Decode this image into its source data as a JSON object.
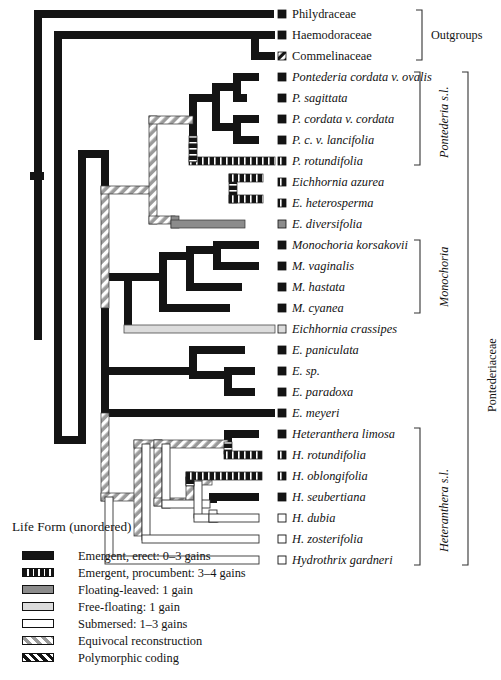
{
  "figure": {
    "name": "pontederiaceae-life-form-phylogeny",
    "width": 501,
    "height": 680
  },
  "taxa": [
    {
      "id": "philydraceae",
      "label": "Philydraceae",
      "italic": false,
      "y": 14,
      "branch_x": 272,
      "state": "emergent-erect",
      "box": "emergent-erect"
    },
    {
      "id": "haemodoraceae",
      "label": "Haemodoraceae",
      "italic": false,
      "y": 35,
      "branch_x": 255,
      "state": "emergent-erect",
      "box": "emergent-erect"
    },
    {
      "id": "commelinaceae",
      "label": "Commelinaceae",
      "italic": false,
      "y": 56,
      "branch_x": 255,
      "state": "emergent-erect",
      "box": "polymorphic"
    },
    {
      "id": "pontederia-cordata-ovalis",
      "label": "Pontederia cordata v. ovalis",
      "italic": true,
      "y": 77,
      "branch_x": 258,
      "state": "emergent-erect",
      "box": "emergent-erect"
    },
    {
      "id": "p-sagittata",
      "label": "P. sagittata",
      "italic": true,
      "y": 98,
      "branch_x": 245,
      "state": "emergent-erect",
      "box": "emergent-erect"
    },
    {
      "id": "p-cordata-cordata",
      "label": "P. cordata v. cordata",
      "italic": true,
      "y": 119,
      "branch_x": 258,
      "state": "emergent-erect",
      "box": "emergent-erect"
    },
    {
      "id": "p-c-lancifolia",
      "label": "P. c. v. lancifolia",
      "italic": true,
      "y": 140,
      "branch_x": 258,
      "state": "emergent-erect",
      "box": "emergent-erect"
    },
    {
      "id": "p-rotundifolia",
      "label": "P. rotundifolia",
      "italic": true,
      "y": 161,
      "branch_x": 215,
      "state": "emergent-procumbent",
      "box": "emergent-procumbent"
    },
    {
      "id": "eichhornia-azurea",
      "label": "Eichhornia azurea",
      "italic": true,
      "y": 182,
      "branch_x": 258,
      "state": "emergent-procumbent",
      "box": "emergent-procumbent"
    },
    {
      "id": "e-heterosperma",
      "label": "E. heterosperma",
      "italic": true,
      "y": 203,
      "branch_x": 258,
      "state": "emergent-procumbent",
      "box": "emergent-procumbent"
    },
    {
      "id": "e-diversifolia",
      "label": "E. diversifolia",
      "italic": true,
      "y": 224,
      "branch_x": 245,
      "state": "floating-leaved",
      "box": "floating-leaved"
    },
    {
      "id": "monochoria-korsakovii",
      "label": "Monochoria korsakovii",
      "italic": true,
      "y": 245,
      "branch_x": 258,
      "state": "emergent-erect",
      "box": "emergent-erect"
    },
    {
      "id": "m-vaginalis",
      "label": "M. vaginalis",
      "italic": true,
      "y": 266,
      "branch_x": 258,
      "state": "emergent-erect",
      "box": "emergent-erect"
    },
    {
      "id": "m-hastata",
      "label": "M. hastata",
      "italic": true,
      "y": 287,
      "branch_x": 240,
      "state": "emergent-erect",
      "box": "emergent-erect"
    },
    {
      "id": "m-cyanea",
      "label": "M. cyanea",
      "italic": true,
      "y": 308,
      "branch_x": 228,
      "state": "emergent-erect",
      "box": "emergent-erect"
    },
    {
      "id": "eichhornia-crassipes",
      "label": "Eichhornia crassipes",
      "italic": true,
      "y": 329,
      "branch_x": 150,
      "state": "free-floating",
      "box": "free-floating"
    },
    {
      "id": "e-paniculata",
      "label": "E. paniculata",
      "italic": true,
      "y": 350,
      "branch_x": 233,
      "state": "emergent-erect",
      "box": "emergent-erect"
    },
    {
      "id": "e-sp",
      "label": "E. sp.",
      "italic": true,
      "y": 371,
      "branch_x": 253,
      "state": "emergent-erect",
      "box": "emergent-erect"
    },
    {
      "id": "e-paradoxa",
      "label": "E. paradoxa",
      "italic": true,
      "y": 392,
      "branch_x": 253,
      "state": "emergent-erect",
      "box": "emergent-erect"
    },
    {
      "id": "e-meyeri",
      "label": "E. meyeri",
      "italic": true,
      "y": 413,
      "branch_x": 102,
      "state": "emergent-erect",
      "box": "emergent-erect"
    },
    {
      "id": "heteranthera-limosa",
      "label": "Heteranthera limosa",
      "italic": true,
      "y": 434,
      "branch_x": 258,
      "state": "emergent-erect",
      "box": "emergent-erect"
    },
    {
      "id": "h-rotundifolia",
      "label": "H. rotundifolia",
      "italic": true,
      "y": 455,
      "branch_x": 258,
      "state": "emergent-procumbent",
      "box": "emergent-procumbent"
    },
    {
      "id": "h-oblongifolia",
      "label": "H. oblongifolia",
      "italic": true,
      "y": 476,
      "branch_x": 232,
      "state": "emergent-procumbent",
      "box": "emergent-procumbent"
    },
    {
      "id": "h-seubertiana",
      "label": "H. seubertiana",
      "italic": true,
      "y": 497,
      "branch_x": 258,
      "state": "emergent-erect",
      "box": "emergent-erect"
    },
    {
      "id": "h-dubia",
      "label": "H. dubia",
      "italic": true,
      "y": 518,
      "branch_x": 258,
      "state": "submersed",
      "box": "submersed"
    },
    {
      "id": "h-zosterifolia",
      "label": "H. zosterifolia",
      "italic": true,
      "y": 539,
      "branch_x": 202,
      "state": "submersed",
      "box": "submersed"
    },
    {
      "id": "hydrothrix-gardneri",
      "label": "Hydrothrix gardneri",
      "italic": true,
      "y": 560,
      "branch_x": 168,
      "state": "submersed",
      "box": "submersed"
    }
  ],
  "clade_brackets": [
    {
      "id": "outgroups",
      "label": "Outgroups",
      "italic": false,
      "vertical": false,
      "x": 422,
      "y_top": 10,
      "y_bottom": 60,
      "label_x": 443,
      "label_y": 34
    },
    {
      "id": "pontederia-sl",
      "label": "Pontederia s.l.",
      "italic": true,
      "vertical": true,
      "x": 420,
      "y_top": 72,
      "y_bottom": 165,
      "label_x": 438,
      "label_y": 155
    },
    {
      "id": "monochoria",
      "label": "Monochoria",
      "italic": true,
      "vertical": true,
      "x": 420,
      "y_top": 240,
      "y_bottom": 313,
      "label_x": 438,
      "label_y": 305
    },
    {
      "id": "heteranthera-sl",
      "label": "Heteranthera s.l.",
      "italic": true,
      "vertical": true,
      "x": 420,
      "y_top": 428,
      "y_bottom": 565,
      "label_x": 438,
      "label_y": 550
    },
    {
      "id": "pontederiaceae",
      "label": "Pontederiaceae",
      "italic": false,
      "vertical": true,
      "x": 468,
      "y_top": 72,
      "y_bottom": 565,
      "label_x": 486,
      "label_y": 390
    }
  ],
  "legend": {
    "title": "Life Form (unordered)",
    "items": [
      {
        "id": "emergent-erect",
        "label": "Emergent, erect: 0–3 gains",
        "swatch": "emergent-erect",
        "y": 549
      },
      {
        "id": "emergent-procumbent",
        "label": "Emergent, procumbent: 3–4 gains",
        "swatch": "emergent-procumbent",
        "y": 566
      },
      {
        "id": "floating-leaved",
        "label": "Floating-leaved: 1 gain",
        "swatch": "floating-leaved",
        "y": 583
      },
      {
        "id": "free-floating",
        "label": "Free-floating: 1 gain",
        "swatch": "free-floating",
        "y": 600
      },
      {
        "id": "submersed",
        "label": "Submersed: 1–3 gains",
        "swatch": "submersed",
        "y": 617
      },
      {
        "id": "equivocal",
        "label": "Equivocal reconstruction",
        "swatch": "equivocal",
        "y": 634
      },
      {
        "id": "polymorphic",
        "label": "Polymorphic coding",
        "swatch": "polymorphic",
        "y": 651
      }
    ]
  },
  "colors": {
    "emergent_erect": "#111111",
    "emergent_procumbent": "#1a1a1a",
    "floating_leaved": "#8c8c8c",
    "free_floating": "#d8d8d8",
    "submersed": "#ffffff",
    "equivocal": "#9a9a9a",
    "outline": "#111111",
    "text": "#131313"
  },
  "tree_structure": {
    "root_x": 38,
    "description": "Rectangular cladogram of Pontederiaceae with life-form character states mapped on branches",
    "nodes": [
      {
        "id": "root",
        "x": 38,
        "children_y": [
          14,
          338
        ]
      },
      {
        "id": "n-ingroup",
        "x": 58,
        "y_top": 35,
        "y_bottom": 440
      },
      {
        "id": "n-outgroup-pair",
        "x": 255,
        "y_top": 35,
        "y_bottom": 56
      },
      {
        "id": "n-pontederiaceae",
        "x": 82,
        "y_top": 150,
        "y_bottom": 455
      },
      {
        "id": "n-pont-eich",
        "x": 105,
        "y_top": 190,
        "y_bottom": 310
      },
      {
        "id": "n-pontederia-clade",
        "x": 155,
        "y_top": 120,
        "y_bottom": 224
      },
      {
        "id": "n-pont-core",
        "x": 193,
        "y_top": 98,
        "y_bottom": 161
      },
      {
        "id": "n-pont-4",
        "x": 216,
        "y_top": 87,
        "y_bottom": 130
      },
      {
        "id": "n-pont-ovalis-sag",
        "x": 237,
        "y_top": 77,
        "y_bottom": 98
      },
      {
        "id": "n-pont-cord-lanc",
        "x": 237,
        "y_top": 119,
        "y_bottom": 140
      },
      {
        "id": "n-eichhornia-azurea-grp",
        "x": 175,
        "y_top": 193,
        "y_bottom": 224
      },
      {
        "id": "n-azurea-hetero",
        "x": 233,
        "y_top": 182,
        "y_bottom": 203
      },
      {
        "id": "n-mono-crassipes",
        "x": 128,
        "y_top": 277,
        "y_bottom": 329
      },
      {
        "id": "n-monochoria",
        "x": 163,
        "y_top": 256,
        "y_bottom": 308
      },
      {
        "id": "n-mono-3",
        "x": 190,
        "y_top": 250,
        "y_bottom": 287
      },
      {
        "id": "n-mono-kors-vag",
        "x": 217,
        "y_top": 245,
        "y_bottom": 266
      },
      {
        "id": "n-eich-paniculata-clade",
        "x": 105,
        "y_top": 371,
        "y_bottom": 413
      },
      {
        "id": "n-eich-pan-grp",
        "x": 193,
        "y_top": 350,
        "y_bottom": 381
      },
      {
        "id": "n-eich-sp-para",
        "x": 228,
        "y_top": 371,
        "y_bottom": 392
      },
      {
        "id": "n-heteranthera",
        "x": 105,
        "y_top": 497,
        "y_bottom": 560
      },
      {
        "id": "n-het-core",
        "x": 138,
        "y_top": 444,
        "y_bottom": 539
      },
      {
        "id": "n-het-5",
        "x": 158,
        "y_top": 444,
        "y_bottom": 508
      },
      {
        "id": "n-het-limosa-rot",
        "x": 228,
        "y_top": 434,
        "y_bottom": 455
      },
      {
        "id": "n-het-obl-seu-dub",
        "x": 190,
        "y_top": 481,
        "y_bottom": 518
      },
      {
        "id": "n-het-seu-dub",
        "x": 213,
        "y_top": 497,
        "y_bottom": 518
      }
    ]
  }
}
